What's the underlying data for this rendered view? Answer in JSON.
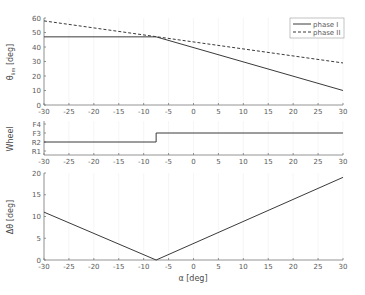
{
  "chart_data": [
    {
      "type": "line",
      "name": "theta_lim",
      "xlabel": "",
      "ylabel": "θ_lim [deg]",
      "xlim": [
        -30,
        30
      ],
      "ylim": [
        0,
        60
      ],
      "xticks": [
        -30,
        -25,
        -20,
        -15,
        -10,
        -5,
        0,
        5,
        10,
        15,
        20,
        25,
        30
      ],
      "yticks": [
        0,
        10,
        20,
        30,
        40,
        50,
        60
      ],
      "legend": {
        "position": "upper right",
        "entries": [
          "phase I",
          "phase II"
        ]
      },
      "series": [
        {
          "name": "phase I",
          "style": "solid",
          "x": [
            -30,
            -7.5,
            30
          ],
          "y": [
            47,
            47,
            10
          ]
        },
        {
          "name": "phase II",
          "style": "dashed",
          "x": [
            -30,
            30
          ],
          "y": [
            58,
            29
          ]
        }
      ]
    },
    {
      "type": "line",
      "name": "wheel",
      "xlabel": "",
      "ylabel": "Wheel",
      "xlim": [
        -30,
        30
      ],
      "xticks": [
        -30,
        -25,
        -20,
        -15,
        -10,
        -5,
        0,
        5,
        10,
        15,
        20,
        25,
        30
      ],
      "yticks": [
        "R1",
        "R2",
        "F3",
        "F4"
      ],
      "series": [
        {
          "name": "wheel",
          "style": "step",
          "x": [
            -30,
            -7.5,
            -7.5,
            30
          ],
          "y": [
            "R2",
            "R2",
            "F3",
            "F3"
          ]
        }
      ]
    },
    {
      "type": "line",
      "name": "delta_theta",
      "xlabel": "α [deg]",
      "ylabel": "Δθ [deg]",
      "xlim": [
        -30,
        30
      ],
      "ylim": [
        0,
        20
      ],
      "xticks": [
        -30,
        -25,
        -20,
        -15,
        -10,
        -5,
        0,
        5,
        10,
        15,
        20,
        25,
        30
      ],
      "yticks": [
        0,
        5,
        10,
        15,
        20
      ],
      "series": [
        {
          "name": "delta",
          "style": "solid",
          "x": [
            -30,
            -7.5,
            30
          ],
          "y": [
            11,
            0,
            19
          ]
        }
      ]
    }
  ],
  "labels": {
    "top_ylabel": "θ",
    "top_ylabel_sub": "lim",
    "top_ylabel_unit": "[deg]",
    "mid_ylabel": "Wheel",
    "bot_ylabel": "Δθ",
    "bot_ylabel_unit": "[deg]",
    "xlabel": "α [deg]",
    "legend_1": "phase I",
    "legend_2": "phase II"
  }
}
